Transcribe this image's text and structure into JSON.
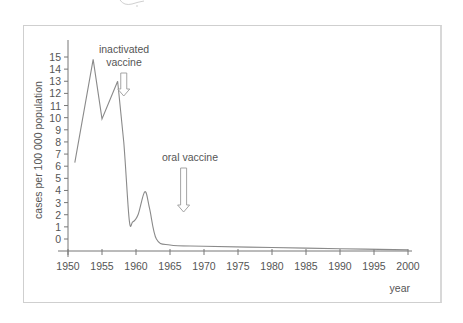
{
  "chart_data": {
    "type": "line",
    "title": "",
    "xlabel": "year",
    "ylabel": "cases per 100 000 population",
    "xlim": [
      1950,
      2000
    ],
    "ylim": [
      -1,
      16
    ],
    "grid": false,
    "legend": null,
    "x_ticks": [
      "1950",
      "1955",
      "1960",
      "1965",
      "1970",
      "1975",
      "1980",
      "1985",
      "1990",
      "1995",
      "2000"
    ],
    "y_ticks": [
      "0",
      "1",
      "2",
      "3",
      "4",
      "5",
      "6",
      "7",
      "8",
      "9",
      "10",
      "11",
      "12",
      "13",
      "14",
      "15"
    ],
    "series": [
      {
        "name": "polio cases",
        "x": [
          1951,
          1953.7,
          1955,
          1957.3,
          1958.2,
          1959.0,
          1959.5,
          1960.3,
          1961.3,
          1962.0,
          1963.0,
          1965,
          1970,
          1980,
          1990,
          2000
        ],
        "values": [
          6.3,
          14.8,
          9.9,
          13.0,
          8.0,
          1.6,
          1.4,
          2.0,
          3.9,
          2.5,
          0.0,
          -0.5,
          -0.6,
          -0.7,
          -0.8,
          -0.9
        ]
      }
    ],
    "annotations": [
      {
        "text_line1": "inactivated",
        "text_line2": "vaccine",
        "x": 1958.2,
        "type": "down-arrow"
      },
      {
        "text_line1": "oral vaccine",
        "x": 1967,
        "type": "down-arrow"
      }
    ]
  },
  "labels": {
    "ylabel": "cases per 100 000 population",
    "xlabel": "year",
    "annot_inactivated_1": "inactivated",
    "annot_inactivated_2": "vaccine",
    "annot_oral": "oral vaccine",
    "x_ticks": [
      "1950",
      "1955",
      "1960",
      "1965",
      "1970",
      "1975",
      "1980",
      "1985",
      "1990",
      "1995",
      "2000"
    ],
    "y_ticks": [
      "0",
      "1",
      "2",
      "3",
      "4",
      "5",
      "6",
      "7",
      "8",
      "9",
      "10",
      "11",
      "12",
      "13",
      "14",
      "15"
    ]
  },
  "colors": {
    "line": "#8a8a8a",
    "axis": "#777777",
    "frame": "#cfcfcf",
    "text": "#555555"
  }
}
